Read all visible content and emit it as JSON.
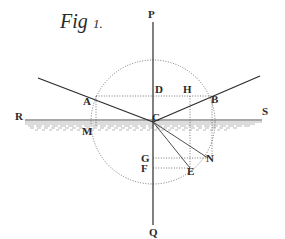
{
  "figure": {
    "title": "Fig",
    "number": "1.",
    "points": {
      "P": "P",
      "Q": "Q",
      "R": "R",
      "S": "S",
      "A": "A",
      "B": "B",
      "C": "C",
      "D": "D",
      "H": "H",
      "M": "M",
      "G": "G",
      "F": "F",
      "N": "N",
      "E": "E"
    },
    "colors": {
      "ink": "#2b2b2b",
      "paper": "#ffffff",
      "water": "#8a8a8a"
    }
  }
}
